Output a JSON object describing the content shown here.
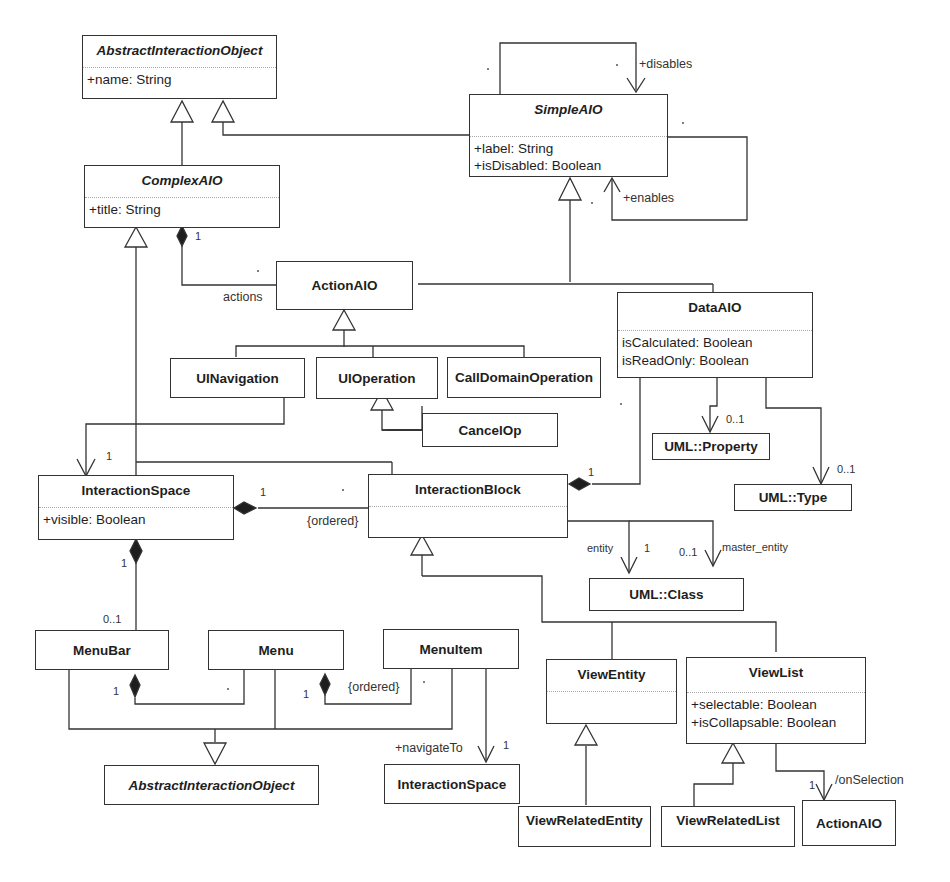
{
  "classes": {
    "aio_top": {
      "name": "AbstractInteractionObject",
      "attrs": [
        "+name: String"
      ]
    },
    "simpleAIO": {
      "name": "SimpleAIO",
      "attrs": [
        "+label: String",
        "+isDisabled: Boolean"
      ]
    },
    "complexAIO": {
      "name": "ComplexAIO",
      "attrs": [
        "+title: String"
      ]
    },
    "actionAIO": {
      "name": "ActionAIO"
    },
    "dataAIO": {
      "name": "DataAIO",
      "attrs": [
        "isCalculated: Boolean",
        "isReadOnly: Boolean"
      ]
    },
    "uiNavigation": {
      "name": "UINavigation"
    },
    "uiOperation": {
      "name": "UIOperation"
    },
    "callDomainOperation": {
      "name": "CallDomainOperation"
    },
    "cancelOp": {
      "name": "CancelOp"
    },
    "umlProperty": {
      "name": "UML::Property"
    },
    "umlType": {
      "name": "UML::Type"
    },
    "interactionSpace": {
      "name": "InteractionSpace",
      "attrs": [
        "+visible: Boolean"
      ]
    },
    "interactionBlock": {
      "name": "InteractionBlock"
    },
    "umlClass": {
      "name": "UML::Class"
    },
    "menuBar": {
      "name": "MenuBar"
    },
    "menu": {
      "name": "Menu"
    },
    "menuItem": {
      "name": "MenuItem"
    },
    "viewEntity": {
      "name": "ViewEntity"
    },
    "viewList": {
      "name": "ViewList",
      "attrs": [
        "+selectable: Boolean",
        "+isCollapsable: Boolean"
      ]
    },
    "aio_bottom": {
      "name": "AbstractInteractionObject"
    },
    "interactionSpace2": {
      "name": "InteractionSpace"
    },
    "viewRelatedEntity": {
      "name": "ViewRelatedEntity"
    },
    "viewRelatedList": {
      "name": "ViewRelatedList"
    },
    "actionAIO2": {
      "name": "ActionAIO"
    }
  },
  "labels": {
    "disables": "+disables",
    "enables": "+enables",
    "actions": "actions",
    "one": "1",
    "zero_one": "0..1",
    "ordered": "{ordered}",
    "entity": "entity",
    "master_entity": "master_entity",
    "navigateTo": "+navigateTo",
    "onSelection": "/onSelection"
  }
}
